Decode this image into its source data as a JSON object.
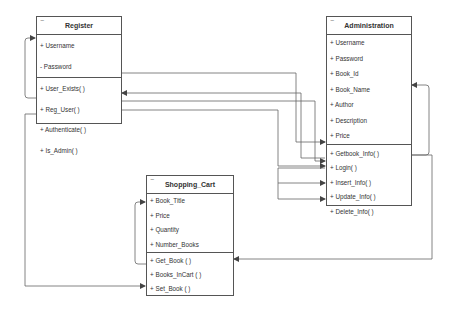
{
  "classes": {
    "register": {
      "title": "Register",
      "collapse_icon": "−",
      "attributes": [
        "+ Username",
        "- Password"
      ],
      "methods": [
        "+ User_Exists( )",
        "+ Reg_User( )",
        "+ Authenticate( )",
        "+ Is_Admin( )"
      ]
    },
    "administration": {
      "title": "Administration",
      "collapse_icon": "−",
      "attributes": [
        "+ Username",
        "+ Password",
        "+ Book_Id",
        "+ Book_Name",
        "+ Author",
        "+ Description",
        "+ Price"
      ],
      "methods": [
        "+ Getbook_Info( )",
        "+ Login( )",
        "+ Insert_Info( )",
        "+ Update_Info( )",
        "+ Delete_Info( )"
      ]
    },
    "shopping_cart": {
      "title": "Shopping_Cart",
      "collapse_icon": "−",
      "attributes": [
        "+ Book_Title",
        "+ Price",
        "+ Quantity",
        "+ Number_Books"
      ],
      "methods": [
        "+ Get_Book ( )",
        "+ Books_InCart ( )",
        "+ Set_Book ( )"
      ]
    }
  },
  "colors": {
    "line": "#555555",
    "border": "#555555",
    "background": "#ffffff"
  }
}
